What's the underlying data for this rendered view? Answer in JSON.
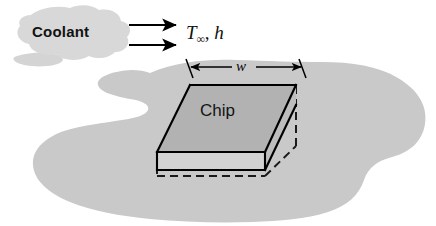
{
  "figure": {
    "name": "chip-convection-cooling-schematic",
    "background_color": "#ffffff"
  },
  "coolant": {
    "label": "Coolant",
    "cloud_fill": "#d8d8d8",
    "arrow_count": 2,
    "arrow_color": "#000000"
  },
  "flow_conditions": {
    "temperature_symbol": "T",
    "temperature_subscript": "∞",
    "separator": ", ",
    "coefficient_symbol": "h",
    "full_label": "T∞, h"
  },
  "substrate": {
    "name": "board-blob",
    "fill": "#c9c9c9"
  },
  "chip": {
    "label": "Chip",
    "top_face_fill": "#b2b2b2",
    "front_face_fill": "#d2d2d2",
    "side_face_fill": "#bdbdbd",
    "edge_color": "#000000",
    "hidden_edge_style": "dashed"
  },
  "dimension": {
    "name": "width-dimension",
    "label": "w",
    "arrow_style": "double-headed",
    "color": "#000000"
  }
}
